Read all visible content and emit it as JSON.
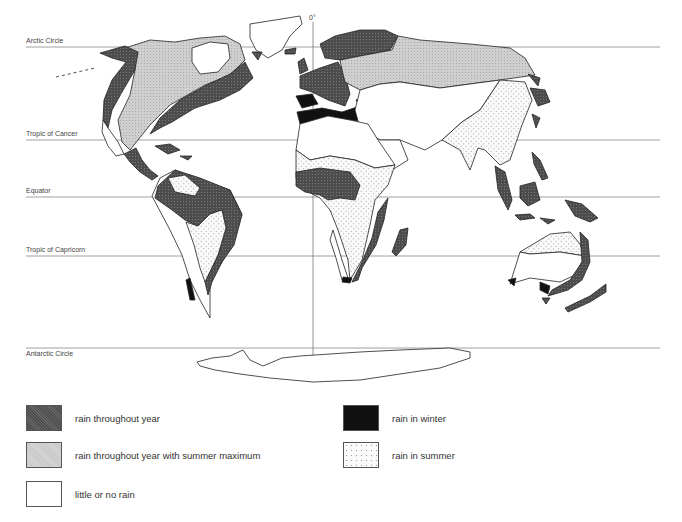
{
  "map": {
    "meridian_label": "0°",
    "latitudes": [
      {
        "name": "arctic-circle",
        "label": "Arctic Circle",
        "y": 47
      },
      {
        "name": "tropic-of-cancer",
        "label": "Tropic of Cancer",
        "y": 140
      },
      {
        "name": "equator",
        "label": "Equator",
        "y": 197
      },
      {
        "name": "tropic-of-capricorn",
        "label": "Tropic of Capricorn",
        "y": 256
      },
      {
        "name": "antarctic-circle",
        "label": "Antarctic Circle",
        "y": 348
      }
    ]
  },
  "legend": {
    "items": [
      {
        "key": "rain-throughout-year",
        "label": "rain throughout year",
        "color": "#555555"
      },
      {
        "key": "rain-throughout-year-summer-max",
        "label": "rain throughout year with summer maximum",
        "color": "#c8c8c8"
      },
      {
        "key": "little-or-no-rain",
        "label": "little or no rain",
        "color": "#ffffff"
      },
      {
        "key": "rain-in-winter",
        "label": "rain in winter",
        "color": "#111111"
      },
      {
        "key": "rain-in-summer",
        "label": "rain in summer",
        "color": "#f4f4f4"
      }
    ]
  }
}
